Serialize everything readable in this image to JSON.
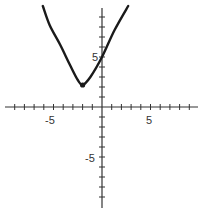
{
  "chart_data": {
    "type": "line",
    "title": "",
    "xlabel": "",
    "ylabel": "",
    "xlim": [
      -10,
      10
    ],
    "ylim": [
      -10,
      10
    ],
    "grid": false,
    "x_tick_labels": [
      {
        "value": -5,
        "label": "-5"
      },
      {
        "value": 5,
        "label": "5"
      }
    ],
    "y_tick_labels": [
      {
        "value": 5,
        "label": "5"
      },
      {
        "value": -5,
        "label": "-5"
      }
    ],
    "tick_step": 1,
    "series": [
      {
        "name": "curve",
        "description": "Upward-opening parabola-like curve with vertex near (-2, 2), y-intercept 5",
        "points": [
          {
            "x": -6.1,
            "y": 10.1
          },
          {
            "x": -5.4,
            "y": 8.2
          },
          {
            "x": -4.3,
            "y": 6.2
          },
          {
            "x": -3.3,
            "y": 4.2
          },
          {
            "x": -2.5,
            "y": 2.7
          },
          {
            "x": -2.0,
            "y": 2.2
          },
          {
            "x": -1.2,
            "y": 3.0
          },
          {
            "x": 0,
            "y": 5
          },
          {
            "x": 1.3,
            "y": 7.7
          },
          {
            "x": 2.7,
            "y": 10.1
          }
        ],
        "marked_point": {
          "x": -2,
          "y": 2.2
        }
      }
    ]
  },
  "labels": {
    "x_neg5": "-5",
    "x_pos5": "5",
    "y_pos5": "5",
    "y_neg5": "-5"
  }
}
